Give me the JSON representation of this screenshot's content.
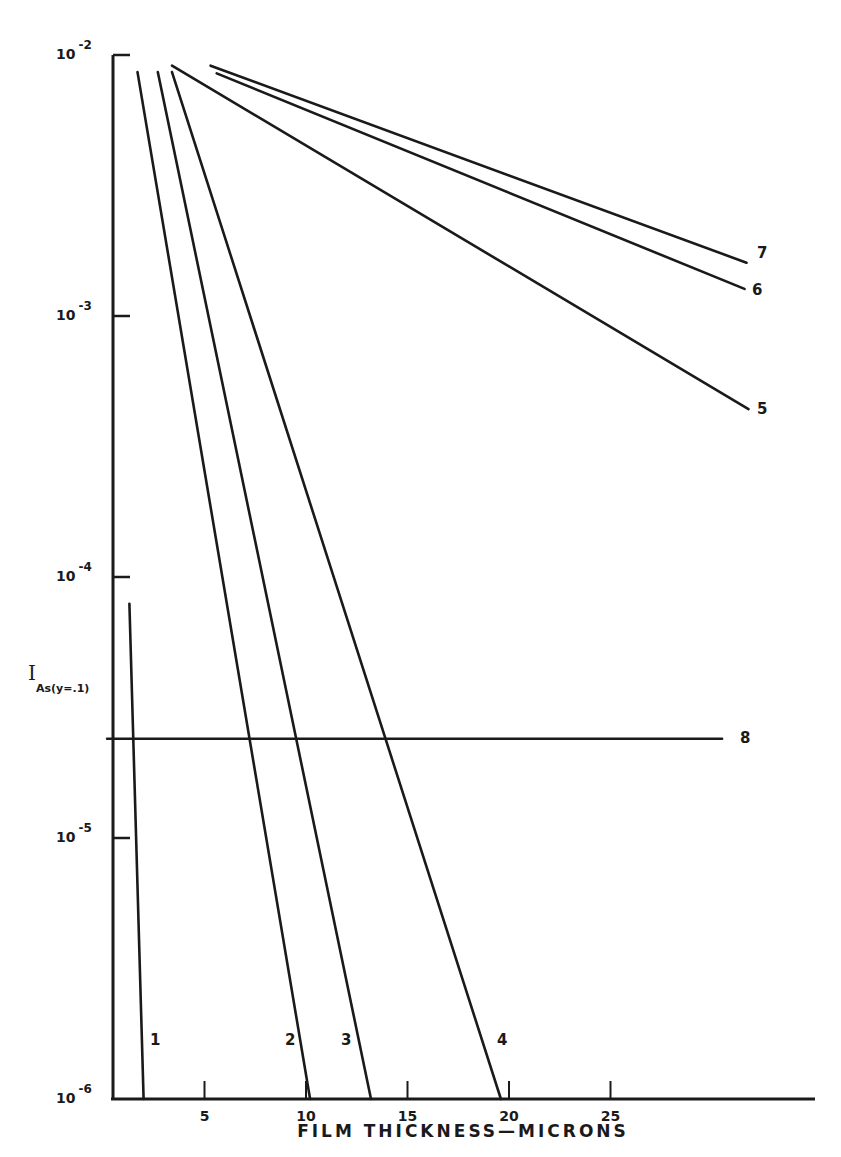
{
  "chart_data": {
    "type": "line",
    "title": "",
    "xlabel": "FILM THICKNESS—MICRONS",
    "ylabel": "I",
    "ylabel_subscript": "As(y=.1)",
    "yscale": "log",
    "xlim": [
      0.5,
      35
    ],
    "ylim": [
      1e-06,
      0.01
    ],
    "grid": false,
    "legend": "inline labels at line ends",
    "x_ticks": [
      5,
      10,
      15,
      20,
      25
    ],
    "x_tick_labels": [
      "5",
      "10",
      "15",
      "20",
      "25"
    ],
    "y_ticks": [
      0.01,
      0.001,
      0.0001,
      1e-05,
      1e-06
    ],
    "y_tick_labels": [
      {
        "base": "10",
        "exp": "-2"
      },
      {
        "base": "10",
        "exp": "-3"
      },
      {
        "base": "10",
        "exp": "-4"
      },
      {
        "base": "10",
        "exp": "-5"
      },
      {
        "base": "10",
        "exp": "-6"
      }
    ],
    "series": [
      {
        "name": "1",
        "x": [
          1.3,
          2.0
        ],
        "y": [
          7.9e-05,
          1e-06
        ]
      },
      {
        "name": "2",
        "x": [
          1.7,
          10.2
        ],
        "y": [
          0.0086,
          1e-06
        ]
      },
      {
        "name": "3",
        "x": [
          2.7,
          13.2
        ],
        "y": [
          0.0086,
          1e-06
        ]
      },
      {
        "name": "4",
        "x": [
          3.4,
          19.6
        ],
        "y": [
          0.0086,
          1e-06
        ]
      },
      {
        "name": "5",
        "x": [
          3.4,
          31.8
        ],
        "y": [
          0.0091,
          0.00044
        ]
      },
      {
        "name": "6",
        "x": [
          5.6,
          31.6
        ],
        "y": [
          0.0085,
          0.00127
        ]
      },
      {
        "name": "7",
        "x": [
          5.3,
          31.7
        ],
        "y": [
          0.0091,
          0.0016
        ]
      },
      {
        "name": "8",
        "x": [
          0.2,
          30.5
        ],
        "y": [
          2.4e-05,
          2.4e-05
        ]
      }
    ],
    "line_color": "#1a1a1a",
    "background": "#ffffff"
  }
}
